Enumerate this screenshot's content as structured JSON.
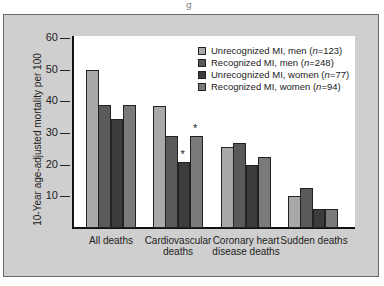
{
  "chart_data": {
    "type": "bar",
    "title": "",
    "xlabel": "",
    "ylabel": "10-Year age-adjusted mortality per 100",
    "ylim": [
      0,
      60
    ],
    "yticks": [
      10,
      20,
      30,
      40,
      50,
      60
    ],
    "categories": [
      "All deaths",
      "Cardiovascular deaths",
      "Coronary heart disease deaths",
      "Sudden deaths"
    ],
    "series": [
      {
        "name": "Unrecognized MI, men (n=123)",
        "color": "#a9a9a9",
        "values": [
          50,
          38.5,
          25.5,
          10
        ]
      },
      {
        "name": "Recognized MI, men (n=248)",
        "color": "#5a5a5a",
        "values": [
          39,
          29,
          27,
          12.5
        ]
      },
      {
        "name": "Unrecognized MI, women (n=77)",
        "color": "#3c3c3c",
        "values": [
          34.5,
          21,
          20,
          6
        ]
      },
      {
        "name": "Recognized MI, women (n=94)",
        "color": "#7a7a7a",
        "values": [
          39,
          29,
          22.5,
          6
        ]
      }
    ],
    "annotations": [
      {
        "category": "Cardiovascular deaths",
        "series": "Unrecognized MI, women (n=77)",
        "text": "*"
      },
      {
        "category": "Cardiovascular deaths",
        "series": "Recognized MI, women (n=94)",
        "text": "*"
      }
    ],
    "legend_position": "upper right",
    "grid": false
  },
  "page": {
    "top_mark": "g"
  },
  "axis": {
    "ylabel": "10-Year age-adjusted mortality per 100",
    "ticks": [
      "60",
      "50",
      "40",
      "30",
      "20",
      "10"
    ]
  },
  "xlabels": {
    "c0": [
      "All deaths"
    ],
    "c1": [
      "Cardiovascular",
      "deaths"
    ],
    "c2": [
      "Coronary heart",
      "disease deaths"
    ],
    "c3": [
      "Sudden deaths"
    ]
  },
  "legend": {
    "items": [
      {
        "label": "Unrecognized MI, men (",
        "n": "n",
        "rest": "=123)",
        "color": "#a9a9a9"
      },
      {
        "label": "Recognized MI, men (",
        "n": "n",
        "rest": "=248)",
        "color": "#5a5a5a"
      },
      {
        "label": "Unrecognized MI, women (",
        "n": "n",
        "rest": "=77)",
        "color": "#3c3c3c"
      },
      {
        "label": "Recognized MI, women (",
        "n": "n",
        "rest": "=94)",
        "color": "#7a7a7a"
      }
    ]
  }
}
